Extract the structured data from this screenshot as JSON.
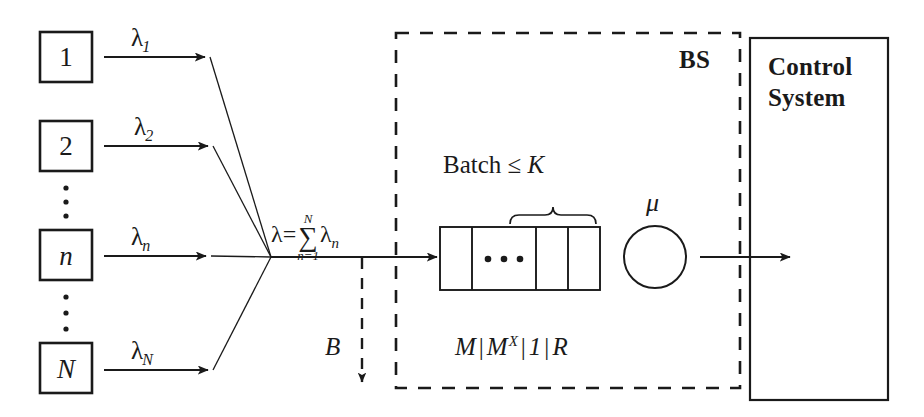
{
  "diagram": {
    "sources": [
      {
        "id": "source-1",
        "label": "1",
        "italic": false,
        "rate_symbol": "λ",
        "rate_subscript": "1"
      },
      {
        "id": "source-2",
        "label": "2",
        "italic": false,
        "rate_symbol": "λ",
        "rate_subscript": "2"
      },
      {
        "id": "source-n",
        "label": "n",
        "italic": true,
        "rate_symbol": "λ",
        "rate_subscript": "n"
      },
      {
        "id": "source-N",
        "label": "N",
        "italic": true,
        "rate_symbol": "λ",
        "rate_subscript": "N"
      }
    ],
    "ellipsis_glyph": "•",
    "aggregate": {
      "lambda": "λ",
      "equals": "=",
      "sigma": "∑",
      "upper_limit": "N",
      "lower_limit": "n=1",
      "term": "λ",
      "term_subscript": "n"
    },
    "blocking": {
      "label": "B"
    },
    "bs": {
      "label": "BS",
      "batch_text": "Batch ≤ ",
      "batch_capacity": "K",
      "service_rate": "μ",
      "kendall": {
        "arrival": "M",
        "service": "M",
        "service_superscript": "X",
        "servers": "1",
        "capacity": "R",
        "separator": "|"
      },
      "queue_cells": [
        "",
        "• • •",
        "",
        ""
      ]
    },
    "control_system": {
      "line1": "Control",
      "line2": "System"
    },
    "colors": {
      "stroke": "#1a1a1a",
      "text": "#1a1a1a",
      "background": "#ffffff"
    }
  }
}
